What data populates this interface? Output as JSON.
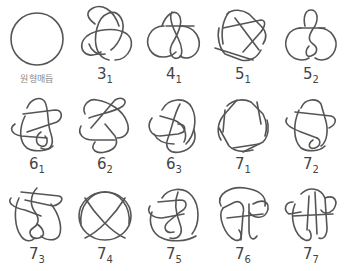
{
  "figure": {
    "stroke_color": "#555555",
    "label_color": "#444444",
    "background": "#ffffff"
  },
  "knots": [
    {
      "id": "unknot",
      "label": "원형매듭",
      "crossings": "",
      "index": ""
    },
    {
      "id": "3_1",
      "label": "",
      "crossings": "3",
      "index": "1"
    },
    {
      "id": "4_1",
      "label": "",
      "crossings": "4",
      "index": "1"
    },
    {
      "id": "5_1",
      "label": "",
      "crossings": "5",
      "index": "1"
    },
    {
      "id": "5_2",
      "label": "",
      "crossings": "5",
      "index": "2"
    },
    {
      "id": "6_1",
      "label": "",
      "crossings": "6",
      "index": "1"
    },
    {
      "id": "6_2",
      "label": "",
      "crossings": "6",
      "index": "2"
    },
    {
      "id": "6_3",
      "label": "",
      "crossings": "6",
      "index": "3"
    },
    {
      "id": "7_1",
      "label": "",
      "crossings": "7",
      "index": "1"
    },
    {
      "id": "7_2",
      "label": "",
      "crossings": "7",
      "index": "2"
    },
    {
      "id": "7_3",
      "label": "",
      "crossings": "7",
      "index": "3"
    },
    {
      "id": "7_4",
      "label": "",
      "crossings": "7",
      "index": "4"
    },
    {
      "id": "7_5",
      "label": "",
      "crossings": "7",
      "index": "5"
    },
    {
      "id": "7_6",
      "label": "",
      "crossings": "7",
      "index": "6"
    },
    {
      "id": "7_7",
      "label": "",
      "crossings": "7",
      "index": "7"
    }
  ]
}
